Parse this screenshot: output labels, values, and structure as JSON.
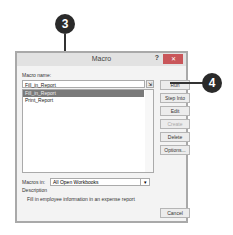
{
  "dialog": {
    "title": "Macro",
    "help_label": "?",
    "close_label": "✕",
    "macro_name_label": "Macro name:",
    "macro_name_value": "Fill_in_Report",
    "macros": [
      {
        "label": "Fill_in_Report",
        "selected": true
      },
      {
        "label": "Print_Report",
        "selected": false
      }
    ],
    "buttons": {
      "run": "Run",
      "step_into": "Step Into",
      "edit": "Edit",
      "create": "Create",
      "delete": "Delete",
      "options": "Options...",
      "cancel": "Cancel"
    },
    "macros_in_label": "Macros in:",
    "macros_in_value": "All Open Workbooks",
    "description_label": "Description",
    "description_text": "Fill in employee information in an expense report"
  },
  "callouts": {
    "step3": "3",
    "step4": "4"
  }
}
